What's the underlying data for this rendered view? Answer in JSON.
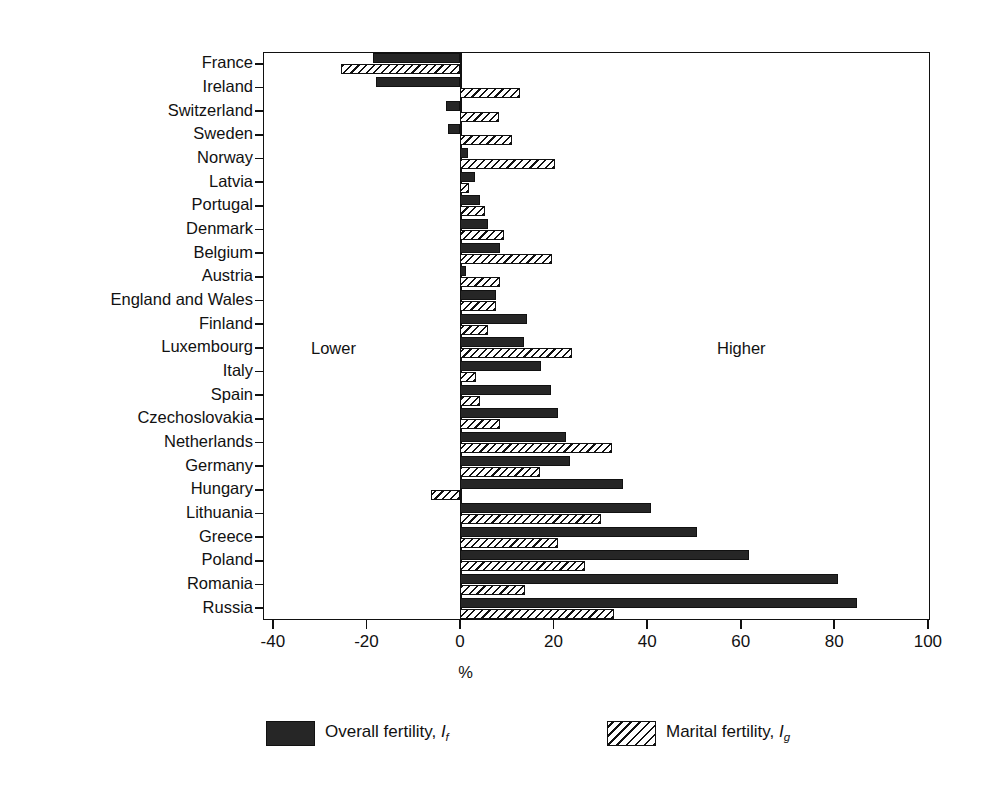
{
  "chart_data": {
    "type": "bar",
    "orientation": "horizontal",
    "title": "",
    "xlabel": "%",
    "ylabel": "",
    "xlim": [
      -40,
      100
    ],
    "xticks": [
      -40,
      -20,
      0,
      20,
      40,
      60,
      80,
      100
    ],
    "xtick_labels": [
      "-40",
      "-20",
      "0",
      "20",
      "40",
      "60",
      "80",
      "100"
    ],
    "grid": false,
    "zero_line": true,
    "legend_position": "bottom",
    "annotations": [
      {
        "text": "Lower",
        "x": -32,
        "side": "left"
      },
      {
        "text": "Higher",
        "x": 55,
        "side": "right"
      }
    ],
    "categories": [
      "France",
      "Ireland",
      "Switzerland",
      "Sweden",
      "Norway",
      "Latvia",
      "Portugal",
      "Denmark",
      "Belgium",
      "Austria",
      "England and Wales",
      "Finland",
      "Luxembourg",
      "Italy",
      "Spain",
      "Czechoslovakia",
      "Netherlands",
      "Germany",
      "Hungary",
      "Lithuania",
      "Greece",
      "Poland",
      "Romania",
      "Russia"
    ],
    "series": [
      {
        "name": "Overall fertility, If",
        "label_main": "Overall fertility,",
        "label_symbol": "I",
        "label_subscript": "f",
        "pattern": "solid",
        "color": "#262626",
        "values": [
          -18.7,
          -18.0,
          -3.0,
          -2.6,
          1.7,
          3.2,
          4.3,
          6.0,
          8.6,
          1.3,
          7.6,
          14.4,
          13.6,
          17.4,
          19.4,
          21.0,
          22.6,
          23.6,
          34.8,
          40.9,
          50.7,
          61.8,
          80.9,
          84.9
        ]
      },
      {
        "name": "Marital fertility, Ig",
        "label_main": "Marital fertility,",
        "label_symbol": "I",
        "label_subscript": "g",
        "pattern": "hatched",
        "color": "#ffffff",
        "values": [
          -25.5,
          12.8,
          8.3,
          11.1,
          20.2,
          1.9,
          5.3,
          9.4,
          19.6,
          8.5,
          7.8,
          6.0,
          24.0,
          3.4,
          4.3,
          8.5,
          32.4,
          17.0,
          -6.2,
          30.2,
          21.0,
          26.8,
          13.8,
          32.9
        ]
      }
    ]
  },
  "legend": {
    "items": [
      {
        "swatch": "solid",
        "text_main": "Overall fertility, ",
        "symbol": "I",
        "sub": "f"
      },
      {
        "swatch": "hatched",
        "text_main": "Marital fertility, ",
        "symbol": "I",
        "sub": "g"
      }
    ]
  }
}
